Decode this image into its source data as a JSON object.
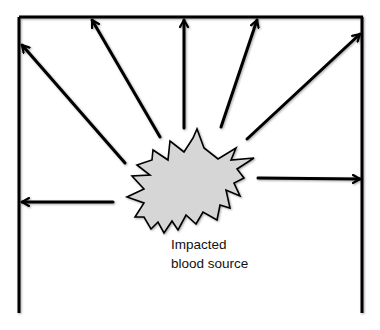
{
  "diagram": {
    "label": {
      "line1": "Impacted",
      "line2": "blood source"
    },
    "colors": {
      "stroke": "#000000",
      "burst_fill": "#d6d6d6",
      "background": "#ffffff"
    },
    "frame": {
      "top": {
        "x1": 19,
        "y1": 17,
        "x2": 363,
        "y2": 17
      },
      "left": {
        "x1": 19,
        "y1": 17,
        "x2": 19,
        "y2": 313
      },
      "right": {
        "x1": 362,
        "y1": 17,
        "x2": 362,
        "y2": 313
      }
    },
    "arrows": [
      {
        "name": "arrow-upper-left-wall",
        "x1": 125,
        "y1": 163,
        "x2": 22,
        "y2": 45
      },
      {
        "name": "arrow-top-left",
        "x1": 160,
        "y1": 137,
        "x2": 92,
        "y2": 20
      },
      {
        "name": "arrow-top-center",
        "x1": 184,
        "y1": 128,
        "x2": 184,
        "y2": 20
      },
      {
        "name": "arrow-top-right",
        "x1": 221,
        "y1": 127,
        "x2": 257,
        "y2": 20
      },
      {
        "name": "arrow-upper-right-corner",
        "x1": 247,
        "y1": 139,
        "x2": 360,
        "y2": 34
      },
      {
        "name": "arrow-right-wall",
        "x1": 258,
        "y1": 178,
        "x2": 360,
        "y2": 179
      },
      {
        "name": "arrow-left-wall",
        "x1": 113,
        "y1": 202,
        "x2": 22,
        "y2": 202
      }
    ]
  }
}
